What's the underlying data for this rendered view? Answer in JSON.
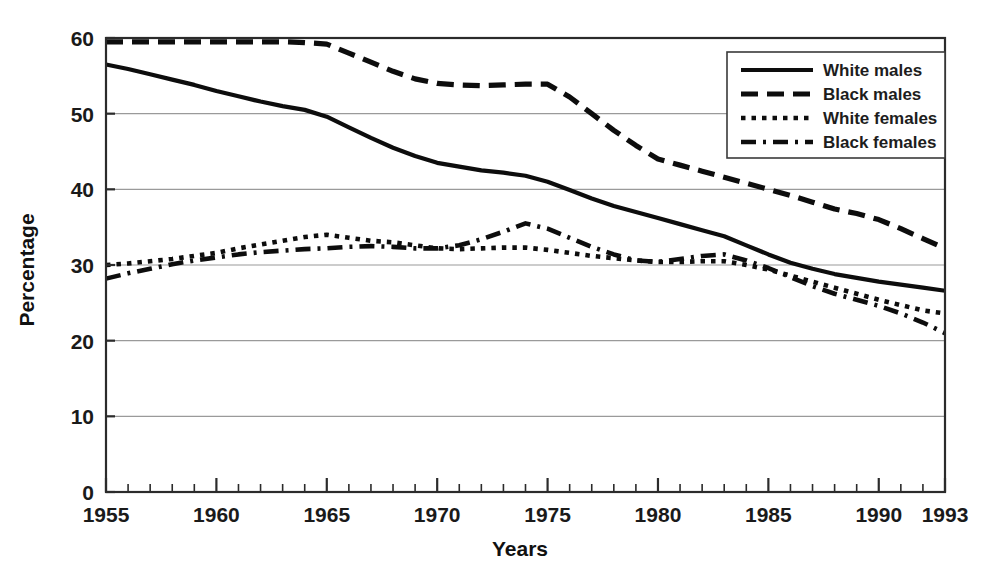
{
  "chart_data": {
    "type": "line",
    "title": "",
    "xlabel": "Years",
    "ylabel": "Percentage",
    "xlim": [
      1955,
      1993
    ],
    "ylim": [
      0,
      60
    ],
    "yticks": [
      0,
      10,
      20,
      30,
      40,
      50,
      60
    ],
    "ytick_labels": [
      "0",
      "10",
      "20",
      "30",
      "40",
      "50",
      "60"
    ],
    "xticks": [
      1955,
      1960,
      1965,
      1970,
      1975,
      1980,
      1985,
      1990,
      1993
    ],
    "xtick_labels": [
      "1955",
      "1960",
      "1965",
      "1970",
      "1975",
      "1980",
      "1985",
      "1990",
      "1993"
    ],
    "x_minor_tick_step": 1,
    "grid": "horizontal",
    "legend_position": "top-right",
    "x": [
      1955,
      1956,
      1957,
      1958,
      1959,
      1960,
      1961,
      1962,
      1963,
      1964,
      1965,
      1966,
      1967,
      1968,
      1969,
      1970,
      1971,
      1972,
      1973,
      1974,
      1975,
      1976,
      1977,
      1978,
      1979,
      1980,
      1981,
      1982,
      1983,
      1984,
      1985,
      1986,
      1987,
      1988,
      1989,
      1990,
      1991,
      1992,
      1993
    ],
    "series": [
      {
        "name": "White males",
        "style": "solid",
        "color": "#0d0d0d",
        "values": [
          56.5,
          55.9,
          55.2,
          54.5,
          53.8,
          53.0,
          52.3,
          51.6,
          51.0,
          50.5,
          49.6,
          48.2,
          46.8,
          45.5,
          44.4,
          43.5,
          43.0,
          42.5,
          42.2,
          41.8,
          41.0,
          39.9,
          38.8,
          37.8,
          37.0,
          36.2,
          35.4,
          34.6,
          33.8,
          32.6,
          31.4,
          30.3,
          29.5,
          28.8,
          28.3,
          27.8,
          27.4,
          27.0,
          26.6
        ]
      },
      {
        "name": "Black males",
        "style": "dashed",
        "color": "#0d0d0d",
        "values": [
          59.5,
          59.5,
          59.5,
          59.5,
          59.5,
          59.5,
          59.5,
          59.5,
          59.5,
          59.4,
          59.2,
          58.0,
          56.8,
          55.6,
          54.6,
          54.0,
          53.8,
          53.7,
          53.8,
          53.9,
          53.9,
          52.2,
          50.0,
          47.8,
          45.8,
          44.0,
          43.2,
          42.4,
          41.6,
          40.8,
          40.0,
          39.2,
          38.3,
          37.4,
          36.8,
          36.0,
          34.8,
          33.5,
          32.2
        ]
      },
      {
        "name": "White females",
        "style": "dotted",
        "color": "#0d0d0d",
        "values": [
          30.0,
          30.2,
          30.5,
          30.8,
          31.2,
          31.6,
          32.2,
          32.7,
          33.2,
          33.7,
          34.0,
          33.6,
          33.2,
          33.0,
          32.6,
          32.2,
          32.1,
          32.2,
          32.3,
          32.3,
          32.0,
          31.6,
          31.2,
          30.9,
          30.6,
          30.4,
          30.4,
          30.5,
          30.5,
          30.0,
          29.4,
          28.6,
          27.8,
          27.0,
          26.2,
          25.4,
          24.7,
          24.0,
          23.6
        ]
      },
      {
        "name": "Black females",
        "style": "dashdot",
        "color": "#0d0d0d",
        "values": [
          28.2,
          28.9,
          29.5,
          30.1,
          30.6,
          31.0,
          31.4,
          31.7,
          31.9,
          32.1,
          32.2,
          32.4,
          32.5,
          32.4,
          32.2,
          32.2,
          32.6,
          33.4,
          34.4,
          35.5,
          34.8,
          33.6,
          32.4,
          31.4,
          30.6,
          30.4,
          30.8,
          31.2,
          31.4,
          30.6,
          29.6,
          28.4,
          27.2,
          26.2,
          25.4,
          24.6,
          23.6,
          22.4,
          21.0
        ]
      }
    ]
  },
  "legend": {
    "items": [
      {
        "label": "White males"
      },
      {
        "label": "Black males"
      },
      {
        "label": "White females"
      },
      {
        "label": "Black females"
      }
    ]
  }
}
